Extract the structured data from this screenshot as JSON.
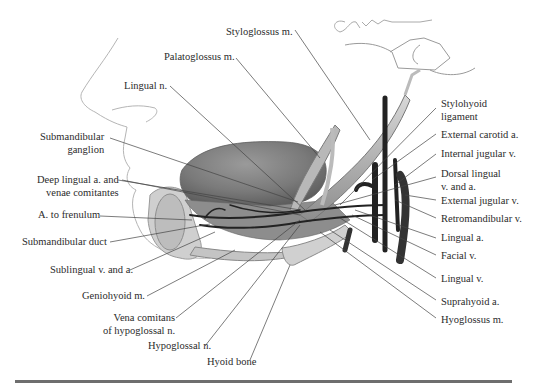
{
  "figure": {
    "signature": "Julia Miller",
    "labels_left": [
      {
        "id": "styloglossus",
        "text": "Styloglossus m.",
        "x": 298,
        "y": 23
      },
      {
        "id": "palatoglossus",
        "text": "Palatoglossus m.",
        "x": 164,
        "y": 51
      },
      {
        "id": "lingual-n",
        "text": "Lingual n.",
        "x": 124,
        "y": 80
      },
      {
        "id": "submandibular-ganglion",
        "lines": [
          "Submandibular",
          "ganglion"
        ],
        "x": 40,
        "y": 132
      },
      {
        "id": "deep-lingual",
        "lines": [
          "Deep lingual a. and",
          "venae comitantes"
        ],
        "x": 37,
        "y": 175
      },
      {
        "id": "a-frenulum",
        "text": "A. to frenulum",
        "x": 38,
        "y": 210
      },
      {
        "id": "submandibular-duct",
        "text": "Submandibular duct",
        "x": 22,
        "y": 236
      },
      {
        "id": "sublingual",
        "text": "Sublingual v. and a.",
        "x": 50,
        "y": 264
      },
      {
        "id": "geniohyoid",
        "text": "Geniohyoid m.",
        "x": 82,
        "y": 290
      },
      {
        "id": "vena-comitans",
        "lines": [
          "Vena comitans",
          "of hypoglossal n."
        ],
        "x": 103,
        "y": 312
      },
      {
        "id": "hypoglossal-n",
        "text": "Hypoglossal n.",
        "x": 148,
        "y": 341
      },
      {
        "id": "hyoid-bone",
        "text": "Hyoid bone",
        "x": 207,
        "y": 357
      }
    ],
    "labels_right": [
      {
        "id": "stylohyoid",
        "lines": [
          "Stylohyoid",
          "ligament"
        ],
        "x": 441,
        "y": 99
      },
      {
        "id": "ext-carotid",
        "text": "External carotid a.",
        "x": 441,
        "y": 129
      },
      {
        "id": "int-jugular",
        "text": "Internal jugular v.",
        "x": 441,
        "y": 148
      },
      {
        "id": "dorsal-lingual",
        "lines": [
          "Dorsal lingual",
          "v. and a."
        ],
        "x": 441,
        "y": 168
      },
      {
        "id": "ext-jugular",
        "text": "External jugular v.",
        "x": 441,
        "y": 195
      },
      {
        "id": "retromandibular",
        "text": "Retromandibular v.",
        "x": 441,
        "y": 213
      },
      {
        "id": "lingual-a",
        "text": "Lingual a.",
        "x": 441,
        "y": 233
      },
      {
        "id": "facial-v",
        "text": "Facial v.",
        "x": 441,
        "y": 250
      },
      {
        "id": "lingual-v",
        "text": "Lingual v.",
        "x": 441,
        "y": 274
      },
      {
        "id": "suprahyoid",
        "text": "Suprahyoid a.",
        "x": 441,
        "y": 296
      },
      {
        "id": "hyoglossus",
        "text": "Hyoglossus m.",
        "x": 441,
        "y": 314
      }
    ],
    "caption_cropped": "…"
  }
}
